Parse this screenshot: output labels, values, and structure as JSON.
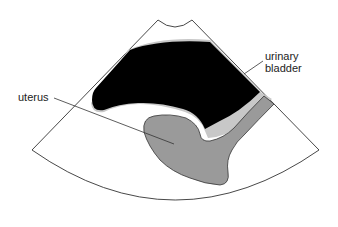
{
  "diagram": {
    "type": "ultrasound-schematic",
    "view": "transabdominal pelvic sector scan",
    "colors": {
      "background": "#ffffff",
      "outline": "#333333",
      "bladder_fill": "#000000",
      "bladder_rim": "#bfbfbf",
      "uterus_fill": "#9a9a9a",
      "leader_line": "#333333"
    },
    "labels": {
      "bladder_line1": "urinary",
      "bladder_line2": "bladder",
      "uterus": "uterus"
    }
  }
}
